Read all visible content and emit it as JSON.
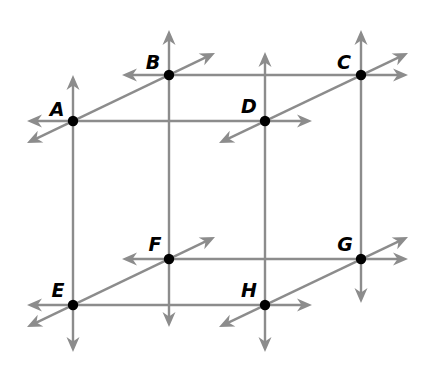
{
  "diagram": {
    "width": 434,
    "height": 370,
    "colors": {
      "line": "#8c8c8c",
      "point": "#000000",
      "label": "#000000",
      "background": "#ffffff"
    },
    "points": [
      {
        "id": "A",
        "label": "A",
        "x": 73,
        "y": 121,
        "label_x": 57,
        "label_y": 109
      },
      {
        "id": "B",
        "label": "B",
        "x": 169,
        "y": 75,
        "label_x": 153,
        "label_y": 62
      },
      {
        "id": "C",
        "label": "C",
        "x": 361,
        "y": 75,
        "label_x": 344,
        "label_y": 62
      },
      {
        "id": "D",
        "label": "D",
        "x": 265,
        "y": 121,
        "label_x": 249,
        "label_y": 106
      },
      {
        "id": "E",
        "label": "E",
        "x": 73,
        "y": 305,
        "label_x": 58,
        "label_y": 290
      },
      {
        "id": "F",
        "label": "F",
        "x": 169,
        "y": 259,
        "label_x": 155,
        "label_y": 244
      },
      {
        "id": "G",
        "label": "G",
        "x": 361,
        "y": 259,
        "label_x": 345,
        "label_y": 244
      },
      {
        "id": "H",
        "label": "H",
        "x": 265,
        "y": 305,
        "label_x": 249,
        "label_y": 290
      }
    ],
    "lines": [
      {
        "id": "line-AD",
        "x1": 27,
        "y1": 121,
        "x2": 312,
        "y2": 121,
        "arrow_start": true,
        "arrow_end": true
      },
      {
        "id": "line-BC",
        "x1": 122,
        "y1": 75,
        "x2": 408,
        "y2": 75,
        "arrow_start": true,
        "arrow_end": true
      },
      {
        "id": "line-EH",
        "x1": 27,
        "y1": 305,
        "x2": 312,
        "y2": 305,
        "arrow_start": true,
        "arrow_end": true
      },
      {
        "id": "line-FG",
        "x1": 122,
        "y1": 259,
        "x2": 408,
        "y2": 259,
        "arrow_start": true,
        "arrow_end": true
      },
      {
        "id": "line-AE",
        "x1": 73,
        "y1": 75,
        "x2": 73,
        "y2": 352,
        "arrow_start": true,
        "arrow_end": true
      },
      {
        "id": "line-BF",
        "x1": 169,
        "y1": 30,
        "x2": 169,
        "y2": 327,
        "arrow_start": true,
        "arrow_end": true
      },
      {
        "id": "line-CG",
        "x1": 361,
        "y1": 30,
        "x2": 361,
        "y2": 303,
        "arrow_start": true,
        "arrow_end": true
      },
      {
        "id": "line-DH",
        "x1": 265,
        "y1": 52,
        "x2": 265,
        "y2": 352,
        "arrow_start": true,
        "arrow_end": true
      },
      {
        "id": "line-AB",
        "x1": 27,
        "y1": 143,
        "x2": 215,
        "y2": 53,
        "arrow_start": true,
        "arrow_end": true
      },
      {
        "id": "line-DC",
        "x1": 219,
        "y1": 143,
        "x2": 408,
        "y2": 53,
        "arrow_start": true,
        "arrow_end": true
      },
      {
        "id": "line-EF",
        "x1": 27,
        "y1": 327,
        "x2": 215,
        "y2": 237,
        "arrow_start": true,
        "arrow_end": true
      },
      {
        "id": "line-HG",
        "x1": 219,
        "y1": 327,
        "x2": 408,
        "y2": 237,
        "arrow_start": true,
        "arrow_end": true
      }
    ]
  }
}
